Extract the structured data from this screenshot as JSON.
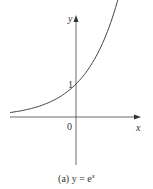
{
  "chart_data": {
    "type": "line",
    "title": "",
    "caption": "(a) y = e^x",
    "xlabel": "x",
    "ylabel": "y",
    "series": [
      {
        "name": "y = e^x",
        "x": [
          -2,
          -1.5,
          -1,
          -0.5,
          0,
          0.5,
          1,
          1.5,
          1.7
        ],
        "y": [
          0.135,
          0.223,
          0.368,
          0.607,
          1.0,
          1.649,
          2.718,
          4.482,
          5.474
        ]
      }
    ],
    "annotations": [
      {
        "text": "1",
        "at": "y-axis intercept"
      },
      {
        "text": "0",
        "at": "origin"
      }
    ],
    "grid": false,
    "legend": null,
    "xlim": [
      -2.0,
      1.95
    ],
    "ylim": [
      -1.45,
      3.1
    ]
  },
  "labels": {
    "y_axis": "y",
    "x_axis": "x",
    "one": "1",
    "origin": "0",
    "caption_prefix": "(a) y = e",
    "caption_sup": "x"
  }
}
